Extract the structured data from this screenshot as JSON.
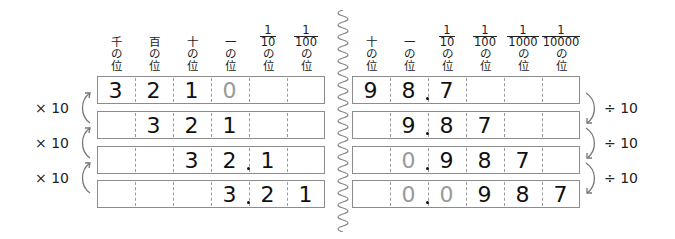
{
  "left_table": {
    "headers": [
      {
        "top": "",
        "lines": [
          "千",
          "の",
          "位"
        ]
      },
      {
        "top": "",
        "lines": [
          "百",
          "の",
          "位"
        ]
      },
      {
        "top": "",
        "lines": [
          "十",
          "の",
          "位"
        ]
      },
      {
        "top": "",
        "lines": [
          "一",
          "の",
          "位"
        ]
      },
      {
        "num": "1",
        "den": "10",
        "lines": [
          "の",
          "位"
        ]
      },
      {
        "num": "1",
        "den": "100",
        "lines": [
          "の",
          "位"
        ]
      }
    ],
    "rows": [
      {
        "cells": [
          "3",
          "2",
          "1",
          "0",
          "",
          ""
        ],
        "gray": [
          3
        ],
        "decimal_after": null
      },
      {
        "cells": [
          "",
          "3",
          "2",
          "1",
          "",
          ""
        ],
        "gray": [],
        "decimal_after": null
      },
      {
        "cells": [
          "",
          "",
          "3",
          "2",
          "1",
          ""
        ],
        "gray": [],
        "decimal_after": 3
      },
      {
        "cells": [
          "",
          "",
          "",
          "3",
          "2",
          "1"
        ],
        "gray": [],
        "decimal_after": 3
      }
    ],
    "operations": [
      "× 10",
      "× 10",
      "× 10"
    ]
  },
  "right_table": {
    "headers": [
      {
        "lines": [
          "十",
          "の",
          "位"
        ]
      },
      {
        "lines": [
          "一",
          "の",
          "位"
        ]
      },
      {
        "num": "1",
        "den": "10",
        "lines": [
          "の",
          "位"
        ]
      },
      {
        "num": "1",
        "den": "100",
        "lines": [
          "の",
          "位"
        ]
      },
      {
        "num": "1",
        "den": "1000",
        "lines": [
          "の",
          "位"
        ]
      },
      {
        "num": "1",
        "den": "10000",
        "lines": [
          "の",
          "位"
        ]
      }
    ],
    "rows": [
      {
        "cells": [
          "9",
          "8",
          "7",
          "",
          "",
          ""
        ],
        "gray": [],
        "decimal_after": 1
      },
      {
        "cells": [
          "",
          "9",
          "8",
          "7",
          "",
          ""
        ],
        "gray": [],
        "decimal_after": 1
      },
      {
        "cells": [
          "",
          "0",
          "9",
          "8",
          "7",
          ""
        ],
        "gray": [
          1
        ],
        "decimal_after": 1
      },
      {
        "cells": [
          "",
          "0",
          "0",
          "9",
          "8",
          "7"
        ],
        "gray": [
          1,
          2
        ],
        "decimal_after": 1
      }
    ],
    "operations": [
      "÷ 10",
      "÷ 10",
      "÷ 10"
    ]
  },
  "colors": {
    "digit": "#111111",
    "placeholder_zero": "#9a9a9a",
    "border": "#8c8c8c",
    "arrow": "#777777"
  }
}
